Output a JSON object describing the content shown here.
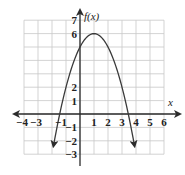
{
  "chart_data": {
    "type": "line",
    "title": "",
    "xlabel": "x",
    "ylabel": "f(x)",
    "xlim": [
      -4,
      6
    ],
    "ylim": [
      -3,
      7
    ],
    "grid": true,
    "function": "f(x) = -(x-1)^2 + 6",
    "vertex": [
      1,
      6
    ],
    "y_intercept": 5,
    "x_intercepts": [
      -1.45,
      3.45
    ],
    "x_tick_labels": [
      "−4",
      "−3",
      "−1",
      "1",
      "2",
      "3",
      "4",
      "5",
      "6"
    ],
    "y_tick_labels": [
      "7",
      "6",
      "2",
      "1",
      "−1",
      "−2",
      "−3"
    ],
    "series": [
      {
        "name": "f(x)",
        "x": [
          -1.9,
          -1.5,
          -1,
          -0.5,
          0,
          0.5,
          1,
          1.5,
          2,
          2.5,
          3,
          3.5,
          3.9
        ],
        "y": [
          -2.41,
          -0.25,
          2,
          3.75,
          5,
          5.75,
          6,
          5.75,
          5,
          3.75,
          2,
          -0.25,
          -2.41
        ],
        "arrows_at_ends": true
      }
    ]
  },
  "axes": {
    "x_label": "x",
    "y_label": "f(x)"
  }
}
